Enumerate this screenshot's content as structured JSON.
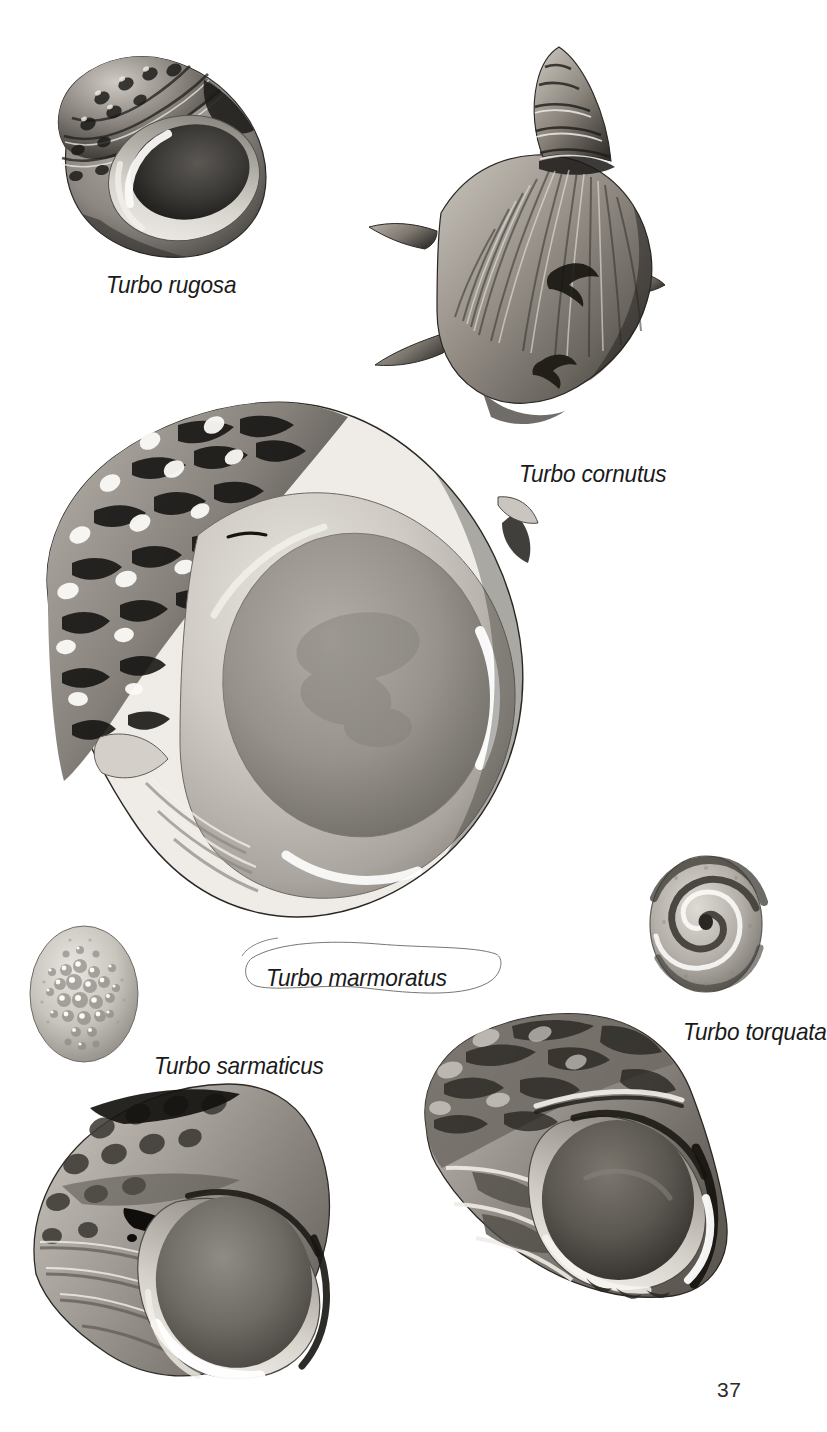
{
  "plate": {
    "kind": "photographic-plate",
    "subject": "Turbo sea shells",
    "background_color": "#ffffff",
    "ink_color": "#1a1a1a",
    "page_number": "37"
  },
  "specimens": [
    {
      "id": "turbo-rugosa",
      "label": "Turbo rugosa",
      "view": "apertural",
      "label_pos": {
        "x": 106,
        "y": 271
      },
      "label_size": 24
    },
    {
      "id": "turbo-cornutus",
      "label": "Turbo cornutus",
      "view": "dorsal",
      "label_pos": {
        "x": 519,
        "y": 460
      },
      "label_size": 24
    },
    {
      "id": "turbo-marmoratus",
      "label": "Turbo marmoratus",
      "view": "apertural",
      "label_pos": {
        "x": 266,
        "y": 964
      },
      "label_size": 24
    },
    {
      "id": "turbo-sarmaticus",
      "label": "Turbo sarmaticus",
      "view": "apertural-and-operculum",
      "label_pos": {
        "x": 154,
        "y": 1052
      },
      "label_size": 24
    },
    {
      "id": "turbo-torquata",
      "label": "Turbo torquata",
      "view": "apertural-and-operculum",
      "label_pos": {
        "x": 683,
        "y": 1018
      },
      "label_size": 24
    }
  ],
  "tones": {
    "paper": "#ffffff",
    "shell_light": "#e2ded8",
    "shell_mid": "#9c9791",
    "shell_dark": "#4a4742",
    "shell_deep": "#1d1c1a",
    "aperture_nacre": "#b9b5ae",
    "aperture_shadow": "#6e6a64"
  }
}
